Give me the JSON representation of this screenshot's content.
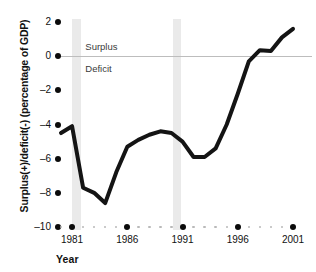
{
  "chart_data": {
    "type": "line",
    "title": "",
    "subtitle": "",
    "xlabel": "Year",
    "ylabel": "Surplus(+)/deficit(-) (percentage of GDP)",
    "xlim": [
      1980,
      2001
    ],
    "ylim": [
      -10,
      2
    ],
    "grid": false,
    "legend": null,
    "y_ticks": [
      2,
      0,
      -2,
      -4,
      -6,
      -8,
      -10
    ],
    "y_tick_labels": [
      "2",
      "0",
      "–2",
      "–4",
      "–6",
      "–8",
      "–10"
    ],
    "x_ticks": [
      1981,
      1986,
      1991,
      1996,
      2001
    ],
    "x_tick_labels": [
      "1981",
      "1986",
      "1991",
      "1996",
      "2001"
    ],
    "x_minor_ticks": [
      1980,
      1982,
      1983,
      1984,
      1985,
      1987,
      1988,
      1989,
      1990,
      1992,
      1993,
      1994,
      1995,
      1997,
      1998,
      1999,
      2000
    ],
    "annotations": [
      {
        "text": "Surplus",
        "x": 1982.2,
        "y": 0.55
      },
      {
        "text": "Deficit",
        "x": 1982.2,
        "y": -0.75
      }
    ],
    "shaded_regions": [
      {
        "label": "recession",
        "x_start": 1981.0,
        "x_end": 1981.8,
        "color": "#eaeaea"
      },
      {
        "label": "recession",
        "x_start": 1990.1,
        "x_end": 1990.9,
        "color": "#eaeaea"
      }
    ],
    "reference_lines": [
      {
        "label": "zero",
        "y": 0,
        "color": "#bdbdbd"
      }
    ],
    "series": [
      {
        "name": "Federal surplus(+)/deficit(-)",
        "color": "#141414",
        "line_width": 4,
        "x": [
          1980,
          1981,
          1982,
          1983,
          1984,
          1985,
          1986,
          1987,
          1988,
          1989,
          1990,
          1991,
          1992,
          1993,
          1994,
          1995,
          1996,
          1997,
          1998,
          1999,
          2000,
          2001
        ],
        "values": [
          -4.5,
          -4.1,
          -7.7,
          -8.0,
          -8.6,
          -6.8,
          -5.3,
          -4.9,
          -4.6,
          -4.4,
          -4.5,
          -5.0,
          -5.9,
          -5.9,
          -5.4,
          -4.0,
          -2.2,
          -0.3,
          0.35,
          0.3,
          1.1,
          1.6
        ]
      }
    ]
  },
  "axis": {
    "y_title": "Surplus(+)/deficit(-) (percentage of GDP)",
    "x_title": "Year"
  }
}
